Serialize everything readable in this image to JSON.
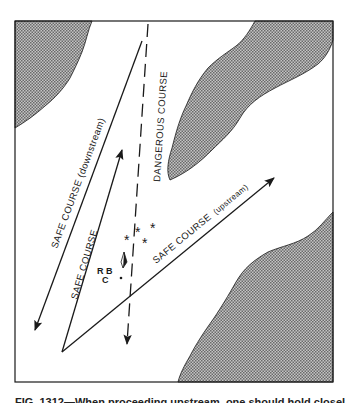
{
  "figure": {
    "labels": {
      "safe_downstream": "SAFE COURSE (downstream)",
      "safe_course": "SAFE COURSE",
      "dangerous": "DANGEROUS COURSE",
      "safe_upstream_main": "SAFE COURSE",
      "safe_upstream_note": "(upstream)"
    },
    "buoy": {
      "letters_top": "R B",
      "letter_bottom": "C"
    },
    "hazard_marks": [
      "*",
      "*",
      "*",
      "*"
    ],
    "colors": {
      "land_fill": "#9a9a9a",
      "line": "#1a1a1a",
      "background": "#ffffff"
    }
  },
  "caption": "FIG. 1312—When proceeding upstream, one should hold closely"
}
